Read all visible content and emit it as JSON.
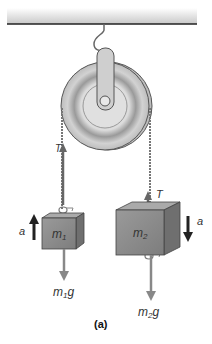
{
  "figure": {
    "caption": "(a)",
    "labels": {
      "tension_left": "T",
      "tension_right": "T",
      "accel_left": "a",
      "accel_right": "a",
      "mass1": "m",
      "mass1_sub": "1",
      "mass2": "m",
      "mass2_sub": "2",
      "weight1": "m",
      "weight1_sub": "1",
      "weight1_suffix": "g",
      "weight2": "m",
      "weight2_sub": "2",
      "weight2_suffix": "g"
    },
    "colors": {
      "ceiling": "#cfcfcf",
      "pulley": "#c9c9c9",
      "block": "#8a8a8a",
      "force_arrow": "#888888",
      "accel_arrow": "#222222"
    }
  }
}
